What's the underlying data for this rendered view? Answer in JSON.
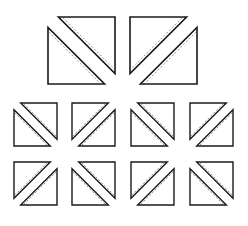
{
  "diagram": {
    "colors": {
      "background": "#ffffff",
      "stroke": "#1a1a1a",
      "dash": "#777777"
    },
    "large_squares": [
      {
        "id": "large-1",
        "x": 48,
        "y": 17,
        "size": 67,
        "diagonal": "tl-br"
      },
      {
        "id": "large-2",
        "x": 130,
        "y": 17,
        "size": 67,
        "diagonal": "tr-bl"
      }
    ],
    "small_squares": [
      {
        "id": "small-1",
        "x": 14,
        "y": 103,
        "size": 43,
        "diagonal": "tl-br"
      },
      {
        "id": "small-2",
        "x": 72,
        "y": 103,
        "size": 43,
        "diagonal": "tr-bl"
      },
      {
        "id": "small-3",
        "x": 131,
        "y": 103,
        "size": 43,
        "diagonal": "tl-br"
      },
      {
        "id": "small-4",
        "x": 190,
        "y": 103,
        "size": 43,
        "diagonal": "tr-bl"
      },
      {
        "id": "small-5",
        "x": 14,
        "y": 162,
        "size": 43,
        "diagonal": "tr-bl"
      },
      {
        "id": "small-6",
        "x": 72,
        "y": 162,
        "size": 43,
        "diagonal": "tl-br"
      },
      {
        "id": "small-7",
        "x": 131,
        "y": 162,
        "size": 43,
        "diagonal": "tr-bl"
      },
      {
        "id": "small-8",
        "x": 190,
        "y": 162,
        "size": 43,
        "diagonal": "tl-br"
      }
    ]
  }
}
